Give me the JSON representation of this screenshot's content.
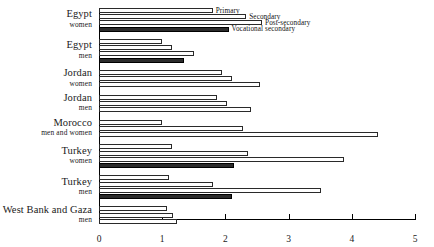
{
  "chart_data": {
    "type": "bar",
    "orientation": "horizontal",
    "title": "",
    "subtitle": "",
    "xlabel": "",
    "ylabel": "",
    "xlim": [
      0,
      5
    ],
    "xticks": [
      0,
      1,
      2,
      3,
      4,
      5
    ],
    "xtick_labels": [
      "0",
      "1",
      "2",
      "3",
      "4",
      "5"
    ],
    "grid": false,
    "legend_position": "inline-callout",
    "series": [
      {
        "name": "Primary",
        "color": "#ffffff",
        "edge_color": "#2a2a2a",
        "values": [
          1.8,
          1.0,
          1.95,
          1.87,
          1.0,
          1.15,
          1.1,
          1.07
        ]
      },
      {
        "name": "Secondary",
        "color": "#ffffff",
        "edge_color": "#2a2a2a",
        "values": [
          2.33,
          1.15,
          2.1,
          2.02,
          2.28,
          2.35,
          1.8,
          1.17
        ]
      },
      {
        "name": "Post-secondary",
        "color": "#ffffff",
        "edge_color": "#2a2a2a",
        "values": [
          2.58,
          1.5,
          2.55,
          2.4,
          4.42,
          3.88,
          3.52,
          1.23
        ]
      },
      {
        "name": "Vocational secondary",
        "color": "#2b2b2b",
        "edge_color": "#000000",
        "values": [
          2.05,
          1.35,
          null,
          null,
          null,
          2.13,
          2.1,
          null
        ]
      }
    ],
    "categories": [
      {
        "country": "Egypt",
        "group": "women"
      },
      {
        "country": "Egypt",
        "group": "men"
      },
      {
        "country": "Jordan",
        "group": "women"
      },
      {
        "country": "Jordan",
        "group": "men"
      },
      {
        "country": "Morocco",
        "group": "men and women"
      },
      {
        "country": "Turkey",
        "group": "women"
      },
      {
        "country": "Turkey",
        "group": "men"
      },
      {
        "country": "West Bank and Gaza",
        "group": "men"
      }
    ],
    "annotations": [
      {
        "text": "Primary",
        "series": "Primary"
      },
      {
        "text": "Secondary",
        "series": "Secondary"
      },
      {
        "text": "Post-secondary",
        "series": "Post-secondary"
      },
      {
        "text": "Vocational secondary",
        "series": "Vocational secondary"
      }
    ]
  },
  "legend": {
    "primary": "Primary",
    "secondary": "Secondary",
    "post_secondary": "Post-secondary",
    "vocational_secondary": "Vocational secondary"
  }
}
